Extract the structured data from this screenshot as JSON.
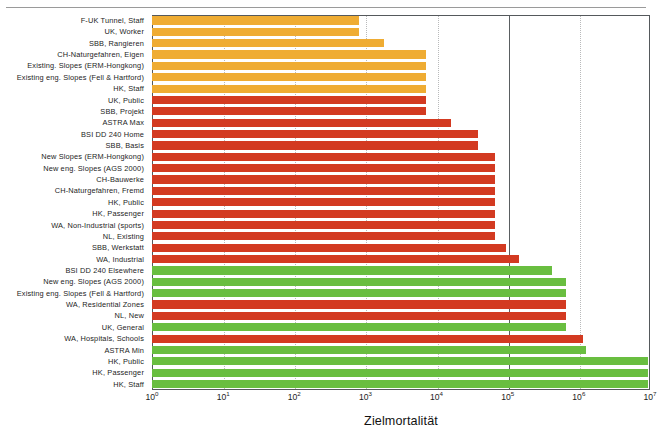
{
  "figure": {
    "axis_title": "Zielmortalität",
    "has_top_rule": true
  },
  "colors": {
    "orange": "#EFAC33",
    "red": "#D33A21",
    "green": "#69BE40",
    "frame": "#55595c",
    "grid_minor": "#b9babb",
    "grid_major": "#5a5e61",
    "background": "#ffffff",
    "text": "#1d1d1d"
  },
  "xticks": [
    {
      "label_base": "10",
      "exponent": "0",
      "value": 1
    },
    {
      "label_base": "10",
      "exponent": "1",
      "value": 10
    },
    {
      "label_base": "10",
      "exponent": "2",
      "value": 100
    },
    {
      "label_base": "10",
      "exponent": "3",
      "value": 1000
    },
    {
      "label_base": "10",
      "exponent": "4",
      "value": 10000
    },
    {
      "label_base": "10",
      "exponent": "5",
      "value": 100000
    },
    {
      "label_base": "10",
      "exponent": "6",
      "value": 1000000
    },
    {
      "label_base": "10",
      "exponent": "7",
      "value": 10000000
    }
  ],
  "gridlines": [
    {
      "value": 10,
      "major": false
    },
    {
      "value": 100,
      "major": false
    },
    {
      "value": 1000,
      "major": false
    },
    {
      "value": 10000,
      "major": false
    },
    {
      "value": 100000,
      "major": true
    },
    {
      "value": 1000000,
      "major": false
    }
  ],
  "chart_data": {
    "type": "bar",
    "orientation": "horizontal",
    "title": "",
    "subtitle": "",
    "xlabel": "Zielmortalität",
    "ylabel": "",
    "xscale": "log",
    "xlim": [
      1,
      10000000
    ],
    "grid": true,
    "legend": null,
    "categories": [
      "F-UK Tunnel, Staff",
      "UK, Worker",
      "SBB, Rangieren",
      "CH-Naturgefahren, Eigen",
      "Existing. Slopes (ERM-Hongkong)",
      "Existing eng. Slopes  (Fell & Hartford)",
      "HK, Staff",
      "UK, Public",
      "SBB, Projekt",
      "ASTRA Max",
      "BSI DD 240 Home",
      "SBB, Basis",
      "New Slopes (ERM-Hongkong)",
      "New eng. Slopes (AGS 2000)",
      "CH-Bauwerke",
      "CH-Naturgefahren, Fremd",
      "HK, Public",
      "HK, Passenger",
      "WA, Non-Industrial (sports)",
      "NL, Existing",
      "SBB, Werkstatt",
      "WA, Industrial",
      "BSI DD 240 Elsewhere",
      "New eng. Slopes (AGS 2000)",
      "Existing eng. Slopes  (Fell & Hartford)",
      "WA, Residential Zones",
      "NL, New",
      "UK, General",
      "WA, Hospitals, Schools",
      "ASTRA Min",
      "HK, Public",
      "HK, Passenger",
      "HK, Staff"
    ],
    "values": [
      800,
      800,
      1800,
      7000,
      7000,
      7000,
      7000,
      7000,
      7000,
      16000,
      38000,
      38000,
      66000,
      66000,
      66000,
      66000,
      66000,
      66000,
      66000,
      66000,
      95000,
      145000,
      420000,
      650000,
      650000,
      650000,
      650000,
      650000,
      1150000,
      1250000,
      9500000,
      9500000,
      9500000
    ],
    "colors": [
      "orange",
      "orange",
      "orange",
      "orange",
      "orange",
      "orange",
      "orange",
      "red",
      "red",
      "red",
      "red",
      "red",
      "red",
      "red",
      "red",
      "red",
      "red",
      "red",
      "red",
      "red",
      "red",
      "red",
      "green",
      "green",
      "green",
      "red",
      "red",
      "green",
      "red",
      "green",
      "green",
      "green",
      "green"
    ]
  }
}
